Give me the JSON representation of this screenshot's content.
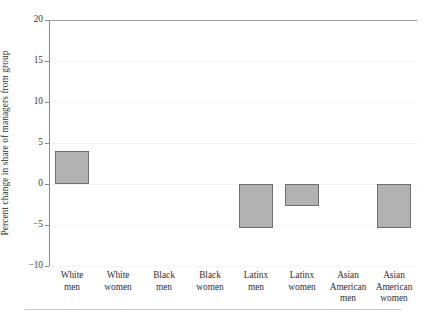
{
  "figure": {
    "top_clipped_caption": "",
    "bottom_rule_name": "footer-rule"
  },
  "axes": {
    "ylabel": "Percent change in share of managers from group",
    "xlabel": "",
    "ytick_labels": [
      "20",
      "15",
      "10",
      "5",
      "0",
      "−5",
      "−10"
    ],
    "ytick_values": [
      20,
      15,
      10,
      5,
      0,
      -5,
      -10
    ]
  },
  "chart_data": {
    "type": "bar",
    "title": "",
    "xlabel": "",
    "ylabel": "Percent change in share of managers from group",
    "ylim": [
      -10,
      20
    ],
    "yticks": [
      -10,
      -5,
      0,
      5,
      10,
      15,
      20
    ],
    "grid": true,
    "legend": "none",
    "zero_baseline": 0,
    "categories": [
      "White men",
      "White women",
      "Black men",
      "Black women",
      "Latinx men",
      "Latinx women",
      "Asian American men",
      "Asian American women"
    ],
    "category_lines": [
      [
        "White",
        "men"
      ],
      [
        "White",
        "women"
      ],
      [
        "Black",
        "men"
      ],
      [
        "Black",
        "women"
      ],
      [
        "Latinx",
        "men"
      ],
      [
        "Latinx",
        "women"
      ],
      [
        "Asian",
        "American",
        "men"
      ],
      [
        "Asian",
        "American",
        "women"
      ]
    ],
    "values": [
      4.0,
      0.0,
      0.0,
      0.0,
      -5.4,
      -2.7,
      0.0,
      -5.4
    ],
    "bar_face_color": "#b2b2b2",
    "bar_edge_color": "#6f6f6f"
  },
  "colors": {
    "bar_fill": "#b2b2b2",
    "bar_stroke": "#6f6f6f",
    "axis": "#8c8c8c",
    "gridline": "#eeeeee",
    "text": "#2e2e2e",
    "rule": "#c9c9c9",
    "background": "#ffffff"
  }
}
